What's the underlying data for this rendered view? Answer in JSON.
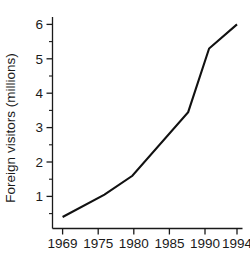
{
  "chart_data": {
    "type": "line",
    "title": "",
    "xlabel": "",
    "ylabel": "Foreign visitors (millions)",
    "x": [
      1969,
      1975,
      1979,
      1987,
      1990,
      1994
    ],
    "values": [
      0.4,
      1.05,
      1.6,
      3.45,
      5.3,
      6.0
    ],
    "series": [
      {
        "name": "Foreign visitors",
        "values": [
          0.4,
          1.05,
          1.6,
          3.45,
          5.3,
          6.0
        ],
        "color": "#111111"
      }
    ],
    "xlim": [
      1969,
      1994
    ],
    "ylim": [
      0,
      6.4
    ],
    "x_tick_labels": [
      "1969",
      "1975",
      "1980",
      "1985",
      "1990",
      "1994"
    ],
    "x_tick_values": [
      1969,
      1975,
      1980,
      1985,
      1990,
      1994
    ],
    "y_tick_labels": [
      "1",
      "2",
      "3",
      "4",
      "5",
      "6"
    ],
    "y_tick_values": [
      1,
      2,
      3,
      4,
      5,
      6
    ],
    "y_minor_tick_values": [
      0.5,
      1.5,
      2.5,
      3.5,
      4.5,
      5.5
    ],
    "grid": false,
    "legend": false,
    "legend_position": "none",
    "markers": false
  },
  "axis": {
    "y_title": "Foreign visitors (millions)",
    "y_tick_labels": [
      "6",
      "5",
      "4",
      "3",
      "2",
      "1"
    ],
    "x_tick_labels": [
      "1969",
      "1975",
      "1980",
      "1985",
      "1990",
      "1994"
    ]
  }
}
